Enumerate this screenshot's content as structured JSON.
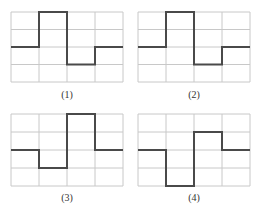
{
  "figure": {
    "grid": {
      "cols": 4,
      "rows": 4,
      "line_color": "#c8c8c8",
      "wave_color": "#4a4a4a"
    },
    "panels": [
      {
        "label": "(1)",
        "levels": [
          2,
          0,
          3,
          2
        ]
      },
      {
        "label": "(2)",
        "levels": [
          2,
          0,
          3,
          2
        ]
      },
      {
        "label": "(3)",
        "levels": [
          2,
          3,
          0,
          2
        ]
      },
      {
        "label": "(4)",
        "levels": [
          2,
          4,
          1,
          2
        ]
      }
    ]
  }
}
